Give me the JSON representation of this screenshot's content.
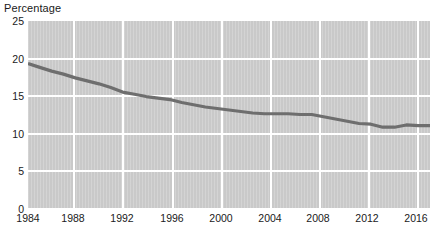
{
  "chart_data": {
    "type": "line",
    "title": "Percentage",
    "xlabel": "",
    "ylabel": "Percentage",
    "ylim": [
      0,
      25
    ],
    "xlim": [
      1984,
      2018
    ],
    "grid": true,
    "legend": null,
    "yticks": [
      25,
      20,
      15,
      10,
      5,
      0
    ],
    "xticks": [
      1984,
      1988,
      1992,
      1996,
      2000,
      2004,
      2008,
      2012,
      2016
    ],
    "x": [
      1984,
      1985,
      1986,
      1987,
      1988,
      1989,
      1990,
      1991,
      1992,
      1993,
      1994,
      1995,
      1996,
      1997,
      1998,
      1999,
      2000,
      2001,
      2002,
      2003,
      2004,
      2005,
      2006,
      2007,
      2008,
      2009,
      2010,
      2011,
      2012,
      2013,
      2014,
      2015,
      2016,
      2017,
      2018
    ],
    "values": [
      19.3,
      18.8,
      18.3,
      17.9,
      17.4,
      17.0,
      16.6,
      16.1,
      15.5,
      15.2,
      14.9,
      14.7,
      14.5,
      14.1,
      13.8,
      13.5,
      13.3,
      13.1,
      12.9,
      12.7,
      12.6,
      12.6,
      12.6,
      12.5,
      12.5,
      12.2,
      11.9,
      11.6,
      11.3,
      11.2,
      10.8,
      10.8,
      11.1,
      11.0,
      11.0
    ],
    "series": [
      {
        "name": "Percentage",
        "color": "#6e6e6e",
        "values": [
          19.3,
          18.8,
          18.3,
          17.9,
          17.4,
          17.0,
          16.6,
          16.1,
          15.5,
          15.2,
          14.9,
          14.7,
          14.5,
          14.1,
          13.8,
          13.5,
          13.3,
          13.1,
          12.9,
          12.7,
          12.6,
          12.6,
          12.6,
          12.5,
          12.5,
          12.2,
          11.9,
          11.6,
          11.3,
          11.2,
          10.8,
          10.8,
          11.1,
          11.0,
          11.0
        ]
      }
    ],
    "colors": {
      "plot_background": "#c9c9c9",
      "gridline": "#ffffff",
      "line": "#6e6e6e",
      "text": "#1a1a1a",
      "page_background": "#ffffff"
    }
  }
}
